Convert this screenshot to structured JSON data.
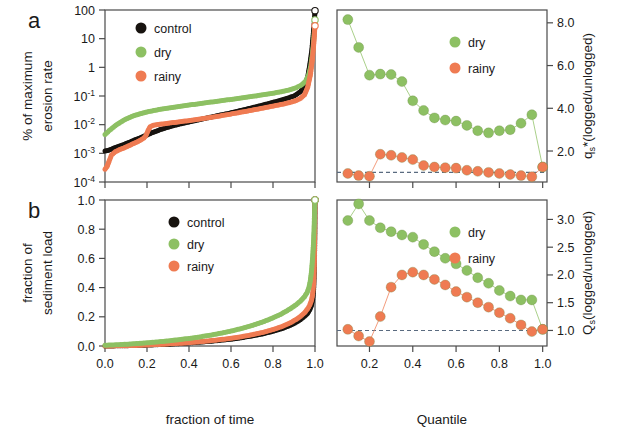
{
  "figure": {
    "panels": [
      {
        "letter": "a",
        "ylabel_line1": "% of maximum",
        "ylabel_line2": "erosion rate"
      },
      {
        "letter": "b",
        "ylabel_line1": "fraction of",
        "ylabel_line2": "sediment load"
      }
    ],
    "xlabel_left": "fraction of time",
    "xlabel_right": "Quantile",
    "ylabel_right_top": "q",
    "ylabel_right_top_sub": "s",
    "ylabel_right_top_rest": "*(logged/unlogged)",
    "ylabel_right_bottom": "Q",
    "ylabel_right_bottom_sub": "s",
    "ylabel_right_bottom_rest": "(logged/unlogged)"
  },
  "colors": {
    "control": "#17130f",
    "dry": "#8dc063",
    "rainy": "#ef7b52",
    "axis": "#4a4a4a",
    "refline": "#5a6b80",
    "background": "#ffffff"
  },
  "legends": {
    "panel_a": [
      "control",
      "dry",
      "rainy"
    ],
    "panel_b": [
      "control",
      "dry",
      "rainy"
    ],
    "panel_c": [
      "dry",
      "rainy"
    ],
    "panel_d": [
      "dry",
      "rainy"
    ]
  },
  "chart_data": [
    {
      "id": "panel-a",
      "type": "line",
      "title": "",
      "xlabel": "fraction of time",
      "ylabel": "% of maximum erosion rate",
      "xlim": [
        0.0,
        1.0
      ],
      "ylim": [
        0.0001,
        100
      ],
      "yscale": "log",
      "xticks": [
        0.0,
        0.2,
        0.4,
        0.6,
        0.8,
        1.0
      ],
      "xticklabels": [
        "",
        "",
        "",
        "",
        "",
        ""
      ],
      "yticks": [
        100,
        10,
        1,
        0.1,
        0.01,
        0.001,
        0.0001
      ],
      "yticklabels": [
        "100",
        "10",
        "1",
        "10-1",
        "10-2",
        "10-3",
        "10-4"
      ],
      "grid": false,
      "legend_position": "upper-left",
      "series": [
        {
          "name": "control",
          "color": "#17130f",
          "x": [
            0.0,
            0.02,
            0.04,
            0.06,
            0.08,
            0.1,
            0.12,
            0.14,
            0.16,
            0.18,
            0.2,
            0.22,
            0.24,
            0.26,
            0.28,
            0.3,
            0.34,
            0.38,
            0.42,
            0.46,
            0.5,
            0.54,
            0.58,
            0.62,
            0.66,
            0.7,
            0.74,
            0.78,
            0.82,
            0.86,
            0.9,
            0.93,
            0.95,
            0.965,
            0.975,
            0.985,
            0.992,
            0.997,
            1.0
          ],
          "y": [
            0.0012,
            0.0013,
            0.0015,
            0.0017,
            0.0019,
            0.0022,
            0.0025,
            0.0029,
            0.0033,
            0.0038,
            0.0044,
            0.0051,
            0.0058,
            0.0066,
            0.0074,
            0.0082,
            0.0098,
            0.0115,
            0.0134,
            0.0155,
            0.018,
            0.021,
            0.024,
            0.028,
            0.033,
            0.039,
            0.046,
            0.055,
            0.066,
            0.08,
            0.1,
            0.14,
            0.22,
            0.45,
            1.2,
            4.0,
            15,
            40,
            95
          ]
        },
        {
          "name": "dry",
          "color": "#8dc063",
          "x": [
            0.0,
            0.02,
            0.04,
            0.06,
            0.08,
            0.1,
            0.12,
            0.14,
            0.16,
            0.18,
            0.2,
            0.24,
            0.28,
            0.32,
            0.36,
            0.4,
            0.44,
            0.48,
            0.52,
            0.56,
            0.6,
            0.64,
            0.68,
            0.72,
            0.76,
            0.8,
            0.84,
            0.88,
            0.91,
            0.935,
            0.955,
            0.97,
            0.98,
            0.988,
            0.994,
            0.998,
            1.0
          ],
          "y": [
            0.0045,
            0.0062,
            0.0082,
            0.0105,
            0.013,
            0.0157,
            0.0183,
            0.0208,
            0.0232,
            0.0255,
            0.0277,
            0.032,
            0.036,
            0.04,
            0.044,
            0.0482,
            0.053,
            0.058,
            0.0635,
            0.0695,
            0.076,
            0.0835,
            0.092,
            0.101,
            0.112,
            0.125,
            0.142,
            0.165,
            0.195,
            0.24,
            0.33,
            0.55,
            1.1,
            3.0,
            9,
            25,
            45
          ]
        },
        {
          "name": "rainy",
          "color": "#ef7b52",
          "x": [
            0.0,
            0.01,
            0.02,
            0.03,
            0.05,
            0.07,
            0.09,
            0.11,
            0.13,
            0.15,
            0.17,
            0.185,
            0.195,
            0.205,
            0.215,
            0.23,
            0.26,
            0.3,
            0.34,
            0.38,
            0.42,
            0.46,
            0.5,
            0.54,
            0.58,
            0.62,
            0.66,
            0.7,
            0.74,
            0.78,
            0.82,
            0.86,
            0.9,
            0.93,
            0.95,
            0.965,
            0.978,
            0.988,
            0.995,
            1.0
          ],
          "y": [
            0.00028,
            0.00035,
            0.00055,
            0.00085,
            0.00115,
            0.00135,
            0.00155,
            0.0018,
            0.0021,
            0.00245,
            0.0029,
            0.0034,
            0.0042,
            0.0062,
            0.0085,
            0.0095,
            0.0103,
            0.0112,
            0.0122,
            0.0133,
            0.0145,
            0.016,
            0.0178,
            0.0198,
            0.0222,
            0.025,
            0.0282,
            0.032,
            0.0365,
            0.0415,
            0.0475,
            0.0545,
            0.065,
            0.082,
            0.11,
            0.2,
            0.55,
            2.0,
            8,
            28
          ]
        }
      ]
    },
    {
      "id": "panel-b",
      "type": "line",
      "title": "",
      "xlabel": "fraction of time",
      "ylabel": "fraction of sediment load",
      "xlim": [
        0.0,
        1.0
      ],
      "ylim": [
        0.0,
        1.0
      ],
      "yscale": "linear",
      "xticks": [
        0.0,
        0.2,
        0.4,
        0.6,
        0.8,
        1.0
      ],
      "xticklabels": [
        "0.0",
        "0.2",
        "0.4",
        "0.6",
        "0.8",
        "1.0"
      ],
      "yticks": [
        0.0,
        0.2,
        0.4,
        0.6,
        0.8,
        1.0
      ],
      "yticklabels": [
        "0.0",
        "0.2",
        "0.4",
        "0.6",
        "0.8",
        "1.0"
      ],
      "grid": false,
      "legend_position": "upper-center",
      "series": [
        {
          "name": "control",
          "color": "#17130f",
          "x": [
            0.0,
            0.05,
            0.1,
            0.15,
            0.2,
            0.25,
            0.3,
            0.35,
            0.4,
            0.45,
            0.5,
            0.55,
            0.6,
            0.65,
            0.7,
            0.75,
            0.8,
            0.84,
            0.88,
            0.91,
            0.93,
            0.95,
            0.965,
            0.975,
            0.983,
            0.989,
            0.994,
            0.997,
            0.999,
            1.0
          ],
          "y": [
            0.0,
            0.001,
            0.002,
            0.004,
            0.006,
            0.009,
            0.012,
            0.016,
            0.021,
            0.026,
            0.032,
            0.039,
            0.047,
            0.057,
            0.069,
            0.083,
            0.101,
            0.118,
            0.14,
            0.162,
            0.18,
            0.203,
            0.225,
            0.248,
            0.278,
            0.32,
            0.4,
            0.54,
            0.76,
            1.0
          ]
        },
        {
          "name": "dry",
          "color": "#8dc063",
          "x": [
            0.0,
            0.05,
            0.1,
            0.15,
            0.2,
            0.25,
            0.3,
            0.35,
            0.4,
            0.45,
            0.5,
            0.55,
            0.6,
            0.65,
            0.7,
            0.75,
            0.8,
            0.84,
            0.88,
            0.91,
            0.93,
            0.95,
            0.962,
            0.971,
            0.978,
            0.984,
            0.989,
            0.993,
            0.996,
            0.998,
            1.0
          ],
          "y": [
            0.005,
            0.008,
            0.012,
            0.017,
            0.022,
            0.028,
            0.035,
            0.043,
            0.052,
            0.062,
            0.074,
            0.087,
            0.102,
            0.12,
            0.14,
            0.164,
            0.193,
            0.22,
            0.253,
            0.283,
            0.307,
            0.338,
            0.365,
            0.4,
            0.45,
            0.52,
            0.61,
            0.71,
            0.82,
            0.92,
            1.0
          ]
        },
        {
          "name": "rainy",
          "color": "#ef7b52",
          "x": [
            0.0,
            0.05,
            0.1,
            0.15,
            0.2,
            0.25,
            0.3,
            0.35,
            0.4,
            0.45,
            0.5,
            0.55,
            0.6,
            0.65,
            0.7,
            0.75,
            0.8,
            0.84,
            0.88,
            0.91,
            0.93,
            0.95,
            0.965,
            0.975,
            0.983,
            0.989,
            0.994,
            0.997,
            0.999,
            1.0
          ],
          "y": [
            0.0,
            0.001,
            0.002,
            0.004,
            0.007,
            0.01,
            0.014,
            0.018,
            0.023,
            0.029,
            0.036,
            0.044,
            0.053,
            0.064,
            0.077,
            0.093,
            0.113,
            0.132,
            0.157,
            0.182,
            0.202,
            0.228,
            0.255,
            0.28,
            0.312,
            0.355,
            0.43,
            0.57,
            0.78,
            1.0
          ]
        }
      ]
    },
    {
      "id": "panel-c",
      "type": "scatter",
      "title": "",
      "xlabel": "Quantile",
      "ylabel": "qs*(logged/unlogged)",
      "xlim": [
        0.05,
        1.02
      ],
      "ylim": [
        0.55,
        8.6
      ],
      "xticks": [
        0.2,
        0.4,
        0.6,
        0.8,
        1.0
      ],
      "xticklabels": [
        "",
        "",
        "",
        "",
        ""
      ],
      "yticks": [
        2.0,
        4.0,
        6.0,
        8.0
      ],
      "yticklabels": [
        "2.0",
        "4.0",
        "6.0",
        "8.0"
      ],
      "reference_line": 1.0,
      "grid": false,
      "legend_position": "upper-right",
      "series": [
        {
          "name": "dry",
          "color": "#8dc063",
          "x": [
            0.1,
            0.15,
            0.2,
            0.25,
            0.3,
            0.35,
            0.4,
            0.45,
            0.5,
            0.55,
            0.6,
            0.65,
            0.7,
            0.75,
            0.8,
            0.85,
            0.9,
            0.95,
            1.0
          ],
          "y": [
            8.15,
            6.85,
            5.55,
            5.6,
            5.58,
            5.25,
            4.35,
            3.9,
            3.55,
            3.45,
            3.4,
            3.2,
            2.95,
            2.85,
            2.95,
            3.0,
            3.3,
            3.7,
            1.25
          ]
        },
        {
          "name": "rainy",
          "color": "#ef7b52",
          "x": [
            0.1,
            0.15,
            0.2,
            0.25,
            0.3,
            0.35,
            0.4,
            0.45,
            0.5,
            0.55,
            0.6,
            0.65,
            0.7,
            0.75,
            0.8,
            0.85,
            0.9,
            0.95,
            1.0
          ],
          "y": [
            0.95,
            0.85,
            0.82,
            1.85,
            1.8,
            1.7,
            1.6,
            1.32,
            1.25,
            1.22,
            1.2,
            1.1,
            1.05,
            1.0,
            0.95,
            0.9,
            0.85,
            0.8,
            1.25
          ]
        }
      ]
    },
    {
      "id": "panel-d",
      "type": "scatter",
      "title": "",
      "xlabel": "Quantile",
      "ylabel": "Qs(logged/unlogged)",
      "xlim": [
        0.05,
        1.02
      ],
      "ylim": [
        0.72,
        3.35
      ],
      "xticks": [
        0.2,
        0.4,
        0.6,
        0.8,
        1.0
      ],
      "xticklabels": [
        "0.2",
        "0.4",
        "0.6",
        "0.8",
        "1.0"
      ],
      "yticks": [
        1.0,
        1.5,
        2.0,
        2.5,
        3.0
      ],
      "yticklabels": [
        "1.0",
        "1.5",
        "2.0",
        "2.5",
        "3.0"
      ],
      "reference_line": 1.0,
      "grid": false,
      "legend_position": "upper-right",
      "series": [
        {
          "name": "dry",
          "color": "#8dc063",
          "x": [
            0.1,
            0.15,
            0.2,
            0.25,
            0.3,
            0.35,
            0.4,
            0.45,
            0.5,
            0.55,
            0.6,
            0.65,
            0.7,
            0.75,
            0.8,
            0.85,
            0.9,
            0.95,
            1.0
          ],
          "y": [
            2.98,
            3.28,
            2.98,
            2.85,
            2.78,
            2.72,
            2.68,
            2.55,
            2.42,
            2.3,
            2.2,
            2.08,
            1.95,
            1.85,
            1.72,
            1.62,
            1.55,
            1.55,
            1.02
          ]
        },
        {
          "name": "rainy",
          "color": "#ef7b52",
          "x": [
            0.1,
            0.15,
            0.2,
            0.25,
            0.3,
            0.35,
            0.4,
            0.45,
            0.5,
            0.55,
            0.6,
            0.65,
            0.7,
            0.75,
            0.8,
            0.85,
            0.9,
            0.95,
            1.0
          ],
          "y": [
            1.02,
            0.9,
            0.8,
            1.25,
            1.78,
            2.0,
            2.05,
            2.0,
            1.92,
            1.82,
            1.7,
            1.6,
            1.5,
            1.42,
            1.32,
            1.22,
            1.1,
            0.98,
            1.02
          ]
        }
      ]
    }
  ]
}
